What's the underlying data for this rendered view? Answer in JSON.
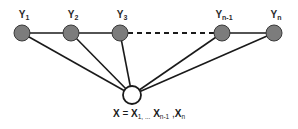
{
  "diagram": {
    "type": "graph-diagram",
    "title": "",
    "background_color": "#ffffff",
    "node_fill_observed": "#7c7c7c",
    "node_fill_hidden": "#ffffff",
    "node_stroke": "#1a1a1a",
    "edge_color": "#1a1a1a",
    "label_color": "#2a2a2a",
    "y_nodes": [
      {
        "id": "y1",
        "label_base": "Y",
        "label_sub": "1",
        "label_text": "Y1",
        "x": 22,
        "y": 33,
        "r": 8,
        "fill": "#7c7c7c",
        "label_x": 24,
        "label_y": 9
      },
      {
        "id": "y2",
        "label_base": "Y",
        "label_sub": "2",
        "label_text": "Y2",
        "x": 71,
        "y": 33,
        "r": 8,
        "fill": "#7c7c7c",
        "label_x": 73,
        "label_y": 9
      },
      {
        "id": "y3",
        "label_base": "Y",
        "label_sub": "3",
        "label_text": "Y3",
        "x": 120,
        "y": 33,
        "r": 8,
        "fill": "#7c7c7c",
        "label_x": 122,
        "label_y": 9
      },
      {
        "id": "yn1",
        "label_base": "Y",
        "label_sub": "n-1",
        "label_text": "Yn-1",
        "x": 222,
        "y": 33,
        "r": 8,
        "fill": "#7c7c7c",
        "label_x": 224,
        "label_y": 9
      },
      {
        "id": "yn",
        "label_base": "Y",
        "label_sub": "n",
        "label_text": "Yn",
        "x": 274,
        "y": 33,
        "r": 8,
        "fill": "#7c7c7c",
        "label_x": 276,
        "label_y": 9
      }
    ],
    "x_node": {
      "id": "x",
      "x": 132,
      "y": 95,
      "r": 9,
      "fill": "#ffffff",
      "caption": {
        "lhs": "X",
        "eq": " = ",
        "terms": [
          {
            "base": "X",
            "sub": "1, ..."
          },
          {
            "base": "X",
            "sub": "n-1"
          },
          {
            "base": "X",
            "sub": "n"
          }
        ],
        "full_text": "X = X1, ... , Xn-1 , Xn"
      }
    },
    "chain_edges": [
      {
        "from": "y1",
        "to": "y2",
        "style": "solid"
      },
      {
        "from": "y2",
        "to": "y3",
        "style": "solid"
      },
      {
        "from": "y3",
        "to": "yn1",
        "style": "dashed"
      },
      {
        "from": "yn1",
        "to": "yn",
        "style": "solid"
      }
    ],
    "x_edges": [
      {
        "from": "x",
        "to": "y1",
        "style": "solid"
      },
      {
        "from": "x",
        "to": "y2",
        "style": "solid"
      },
      {
        "from": "x",
        "to": "y3",
        "style": "solid"
      },
      {
        "from": "x",
        "to": "yn1",
        "style": "solid"
      },
      {
        "from": "x",
        "to": "yn",
        "style": "solid"
      }
    ]
  }
}
